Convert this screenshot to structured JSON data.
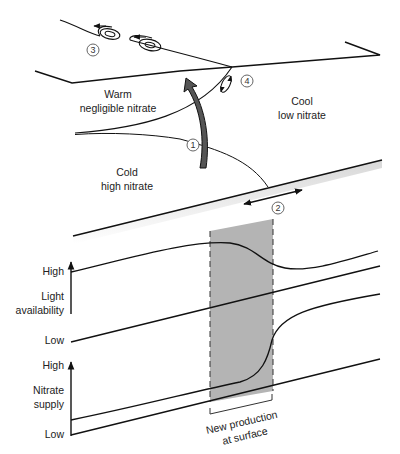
{
  "diagram": {
    "regions": {
      "warm": {
        "line1": "Warm",
        "line2": "negligible nitrate"
      },
      "cool": {
        "line1": "Cool",
        "line2": "low nitrate"
      },
      "cold": {
        "line1": "Cold",
        "line2": "high nitrate"
      }
    },
    "markers": [
      "1",
      "2",
      "3",
      "4"
    ],
    "light_axis": {
      "high": "High",
      "title_line1": "Light",
      "title_line2": "availability",
      "low": "Low"
    },
    "nitrate_axis": {
      "high": "High",
      "title_line1": "Nitrate",
      "title_line2": "supply",
      "low": "Low"
    },
    "production_zone": {
      "line1": "New production",
      "line2": "at surface"
    },
    "colors": {
      "line": "#111111",
      "zone_fill": "#b4b4b4",
      "arrow_fill": "#555555"
    }
  }
}
